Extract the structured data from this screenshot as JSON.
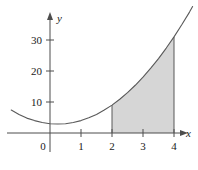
{
  "figure": {
    "type": "graph-figure",
    "background_color": "#ffffff"
  },
  "chart_data": {
    "type": "area",
    "title": "",
    "subtitle": "",
    "xlabel": "x",
    "ylabel": "y",
    "xlim": [
      -1.25,
      4.6
    ],
    "ylim": [
      -3,
      36
    ],
    "grid": false,
    "legend": null,
    "annotations": [],
    "axes": {
      "x_axis_label": "x",
      "y_axis_label": "y",
      "x_ticks": [
        0,
        1,
        2,
        3,
        4
      ],
      "x_tick_labels": [
        "0",
        "1",
        "2",
        "3",
        "4"
      ],
      "y_ticks": [
        10,
        20,
        30
      ],
      "y_tick_labels": [
        "10",
        "20",
        "30"
      ],
      "x_arrow": true,
      "y_arrow": true,
      "axis_color": "#4d4d4d"
    },
    "series": [
      {
        "name": "curve",
        "kind": "line",
        "color": "#595959",
        "x": [
          -1.25,
          -1.0,
          -0.75,
          -0.5,
          -0.25,
          0,
          0.25,
          0.5,
          0.75,
          1.0,
          1.25,
          1.5,
          1.75,
          2.0,
          2.25,
          2.5,
          2.75,
          3.0,
          3.25,
          3.5,
          3.75,
          4.0,
          4.25,
          4.5,
          4.6
        ],
        "y": [
          7.4,
          6.0,
          4.8,
          4.0,
          3.4,
          3.0,
          2.9,
          3.0,
          3.4,
          4.0,
          4.9,
          6.0,
          7.4,
          9.0,
          10.9,
          13.0,
          15.4,
          18.0,
          20.9,
          24.0,
          27.4,
          31.0,
          34.9,
          39.0,
          40.8
        ]
      }
    ],
    "shaded_region": {
      "name": "area-under-curve",
      "fill_color": "#d6d6d6",
      "edge_color": "#595959",
      "x_from": 2,
      "x_to": 4,
      "y_at_x_from": 9,
      "y_at_x_to": 31,
      "bounded_below_by": "x-axis"
    },
    "vertical_boundaries": [
      {
        "name": "left-boundary",
        "x": 2,
        "y_top": 9
      },
      {
        "name": "right-boundary",
        "x": 4,
        "y_top": 31
      }
    ]
  }
}
